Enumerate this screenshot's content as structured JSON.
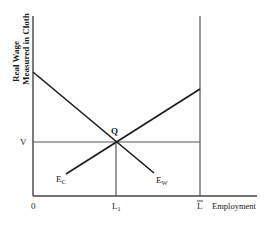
{
  "diagram": {
    "y_axis_label_line1": "Real Wage",
    "y_axis_label_line2": "Measured in Cloth",
    "x_axis_label": "Employment",
    "origin_label": "0",
    "wage_label": "V",
    "equilibrium_label": "Q",
    "employment_label": "L",
    "employment_label_sub": "1",
    "labor_total_label": "L",
    "curves": [
      {
        "name": "E",
        "sub": "C",
        "description": "upward sloping curve"
      },
      {
        "name": "E",
        "sub": "W",
        "description": "downward sloping curve"
      }
    ],
    "colors": {
      "line": "#1a1a1a",
      "gray_line": "#555555"
    }
  }
}
